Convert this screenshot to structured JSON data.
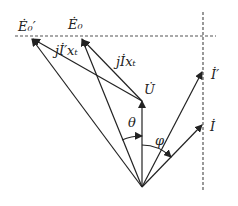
{
  "diagram": {
    "type": "phasor-diagram",
    "labels": {
      "E0_prime": "Ė₀′",
      "E0": "Ė₀",
      "jIprime_xt": "jİ′xₜ",
      "jI_xt": "jİxₜ",
      "U": "U̇",
      "I_prime": "İ′",
      "I": "İ",
      "theta": "θ",
      "phi": "φ"
    },
    "stroke_color": "#222222",
    "dash_color": "#555555"
  }
}
